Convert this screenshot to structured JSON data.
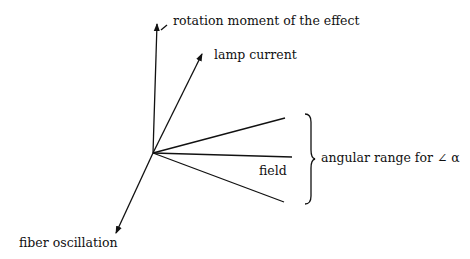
{
  "diagram": {
    "labels": {
      "rotation_moment": "rotation moment of the effect",
      "lamp_current": "lamp current",
      "field": "field",
      "angular_range": "angular range for ∠ α",
      "fiber_oscillation": "fiber oscillation"
    },
    "line_color": "#111111"
  }
}
